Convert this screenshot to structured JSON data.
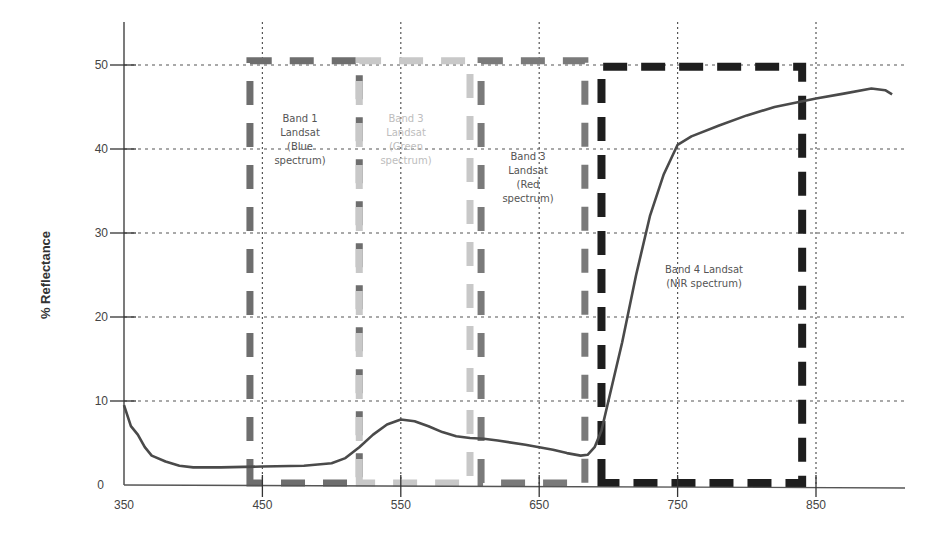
{
  "chart_data": {
    "type": "line",
    "title": "",
    "xlabel": "",
    "ylabel": "% Reflectance",
    "xlim": [
      350,
      905
    ],
    "ylim": [
      0,
      52
    ],
    "grid": true,
    "x_ticks": [
      350,
      450,
      550,
      650,
      750,
      850
    ],
    "y_ticks": [
      0,
      10,
      20,
      30,
      40,
      50
    ],
    "series": [
      {
        "name": "Vegetation reflectance",
        "color": "#4a4a4a",
        "x": [
          350,
          355,
          360,
          365,
          370,
          380,
          390,
          400,
          420,
          450,
          480,
          500,
          510,
          520,
          530,
          540,
          550,
          560,
          570,
          580,
          590,
          600,
          610,
          620,
          640,
          660,
          670,
          680,
          685,
          690,
          695,
          700,
          710,
          720,
          730,
          740,
          750,
          760,
          780,
          800,
          820,
          850,
          870,
          890,
          900,
          905
        ],
        "y": [
          9.5,
          7.0,
          6.0,
          4.5,
          3.5,
          2.8,
          2.3,
          2.1,
          2.1,
          2.2,
          2.3,
          2.6,
          3.2,
          4.5,
          6.0,
          7.2,
          7.8,
          7.6,
          7.0,
          6.3,
          5.8,
          5.6,
          5.5,
          5.3,
          4.8,
          4.2,
          3.8,
          3.5,
          3.6,
          4.5,
          6.5,
          10.0,
          17.0,
          25.0,
          32.0,
          37.0,
          40.5,
          41.5,
          42.8,
          44.0,
          45.0,
          46.0,
          46.6,
          47.2,
          47.0,
          46.5
        ]
      }
    ],
    "bands": [
      {
        "name": "Band 1 Landsat (Blue spectrum)",
        "lines": [
          "Band 1",
          "Landsat",
          "(Blue",
          "spectrum)"
        ],
        "x_start": 441,
        "x_end": 520,
        "y_top": 50.5,
        "color": "#6e6e6e",
        "label_color": "#555555"
      },
      {
        "name": "Band 3 Landsat (Green spectrum)",
        "lines": [
          "Band 3",
          "Landsat",
          "(Green",
          "spectrum)"
        ],
        "x_start": 520,
        "x_end": 600,
        "y_top": 50.5,
        "color": "#c8c8c8",
        "label_color": "#bdbdbd"
      },
      {
        "name": "Band 3 Landsat (Red spectrum)",
        "lines": [
          "Band 3",
          "Landsat",
          "(Red",
          "spectrum)"
        ],
        "x_start": 608,
        "x_end": 683,
        "y_top": 50.5,
        "color": "#7a7a7a",
        "label_color": "#555555"
      },
      {
        "name": "Band 4 Landsat (NIR spectrum)",
        "lines": [
          "Band 4 Landsat",
          "(NIR spectrum)"
        ],
        "x_start": 695,
        "x_end": 840,
        "y_top": 49.8,
        "color": "#1e1e1e",
        "label_color": "#555555"
      }
    ],
    "legend": null
  },
  "axis": {
    "ylabel": "% Reflectance",
    "x_tick_labels": [
      "350",
      "450",
      "550",
      "650",
      "750",
      "850"
    ],
    "y_tick_labels": [
      "0",
      "10",
      "20",
      "30",
      "40",
      "50"
    ]
  }
}
